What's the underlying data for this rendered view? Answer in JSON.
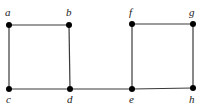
{
  "diagram": {
    "type": "graph",
    "nodes": [
      {
        "id": "a",
        "label": "a",
        "x": 9,
        "y": 25,
        "lx": 5,
        "ly": 16
      },
      {
        "id": "b",
        "label": "b",
        "x": 69,
        "y": 25,
        "lx": 66,
        "ly": 16
      },
      {
        "id": "c",
        "label": "c",
        "x": 9,
        "y": 89,
        "lx": 6,
        "ly": 103
      },
      {
        "id": "d",
        "label": "d",
        "x": 70,
        "y": 89,
        "lx": 67,
        "ly": 103
      },
      {
        "id": "e",
        "label": "e",
        "x": 132,
        "y": 89,
        "lx": 129,
        "ly": 103
      },
      {
        "id": "f",
        "label": "f",
        "x": 132,
        "y": 24,
        "lx": 129,
        "ly": 16
      },
      {
        "id": "g",
        "label": "g",
        "x": 193,
        "y": 24,
        "lx": 189,
        "ly": 16
      },
      {
        "id": "h",
        "label": "h",
        "x": 193,
        "y": 88,
        "lx": 189,
        "ly": 103
      }
    ],
    "edges": [
      [
        "a",
        "b"
      ],
      [
        "a",
        "c"
      ],
      [
        "b",
        "d"
      ],
      [
        "c",
        "d"
      ],
      [
        "d",
        "e"
      ],
      [
        "e",
        "f"
      ],
      [
        "f",
        "g"
      ],
      [
        "g",
        "h"
      ],
      [
        "e",
        "h"
      ]
    ]
  }
}
